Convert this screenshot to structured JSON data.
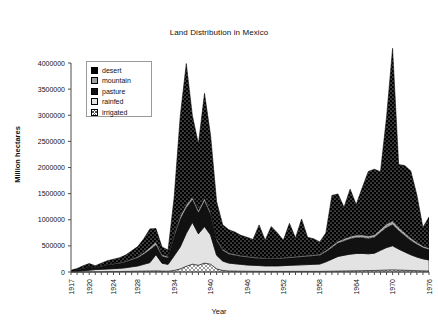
{
  "chart_data": {
    "type": "area",
    "title": "Land Distribution in Mexico",
    "xlabel": "Year",
    "ylabel": "Million hectares",
    "stacked": true,
    "grid": false,
    "legend_position": "inside-top-left",
    "ylim": [
      0,
      4000000
    ],
    "ytick_labels": [
      "4000000",
      "3500000",
      "3000000",
      "2500000",
      "2000000",
      "1500000",
      "1000000",
      "500000",
      "0"
    ],
    "ytick_values": [
      4000000,
      3500000,
      3000000,
      2500000,
      2000000,
      1500000,
      1000000,
      500000,
      0
    ],
    "xlim": [
      1917,
      1976
    ],
    "xtick_labels": [
      "1917",
      "1920",
      "1924",
      "1928",
      "1934",
      "1940",
      "1946",
      "1952",
      "1958",
      "1964",
      "1970",
      "1976"
    ],
    "xtick_values": [
      1917,
      1920,
      1924,
      1928,
      1934,
      1940,
      1946,
      1952,
      1958,
      1964,
      1970,
      1976
    ],
    "x": [
      1917,
      1918,
      1919,
      1920,
      1921,
      1922,
      1923,
      1924,
      1925,
      1926,
      1927,
      1928,
      1929,
      1930,
      1931,
      1932,
      1933,
      1934,
      1935,
      1936,
      1937,
      1938,
      1939,
      1940,
      1941,
      1942,
      1943,
      1944,
      1945,
      1946,
      1947,
      1948,
      1949,
      1950,
      1951,
      1952,
      1953,
      1954,
      1955,
      1956,
      1957,
      1958,
      1959,
      1960,
      1961,
      1962,
      1963,
      1964,
      1965,
      1966,
      1967,
      1968,
      1969,
      1970,
      1971,
      1972,
      1973,
      1974,
      1975,
      1976
    ],
    "series": [
      {
        "name": "irrigated",
        "swatch": "irrigated-swatch",
        "values": [
          2000,
          3000,
          4000,
          5000,
          6000,
          7000,
          8000,
          9000,
          10000,
          12000,
          14000,
          16000,
          18000,
          20000,
          22000,
          18000,
          16000,
          30000,
          60000,
          110000,
          150000,
          130000,
          170000,
          150000,
          60000,
          30000,
          20000,
          18000,
          16000,
          15000,
          14000,
          13000,
          12000,
          12000,
          12000,
          12000,
          12000,
          12000,
          12000,
          12000,
          12000,
          12000,
          14000,
          16000,
          18000,
          20000,
          22000,
          24000,
          26000,
          28000,
          30000,
          34000,
          38000,
          42000,
          38000,
          34000,
          30000,
          26000,
          22000,
          20000
        ]
      },
      {
        "name": "rainfed",
        "swatch": "rainfed-swatch",
        "values": [
          8000,
          12000,
          20000,
          30000,
          40000,
          45000,
          50000,
          55000,
          60000,
          70000,
          85000,
          100000,
          130000,
          160000,
          310000,
          150000,
          130000,
          280000,
          420000,
          630000,
          800000,
          600000,
          700000,
          560000,
          260000,
          180000,
          150000,
          140000,
          130000,
          120000,
          115000,
          110000,
          105000,
          105000,
          105000,
          110000,
          115000,
          120000,
          125000,
          130000,
          135000,
          140000,
          180000,
          230000,
          280000,
          300000,
          320000,
          330000,
          330000,
          320000,
          330000,
          380000,
          430000,
          460000,
          400000,
          350000,
          300000,
          260000,
          230000,
          210000
        ]
      },
      {
        "name": "pasture",
        "swatch": "pasture-swatch",
        "values": [
          12000,
          25000,
          45000,
          60000,
          35000,
          55000,
          75000,
          85000,
          95000,
          110000,
          130000,
          150000,
          190000,
          240000,
          180000,
          130000,
          120000,
          360000,
          520000,
          480000,
          430000,
          400000,
          480000,
          380000,
          280000,
          200000,
          170000,
          160000,
          150000,
          145000,
          140000,
          135000,
          130000,
          130000,
          130000,
          135000,
          140000,
          145000,
          150000,
          155000,
          160000,
          165000,
          190000,
          220000,
          250000,
          270000,
          290000,
          300000,
          300000,
          290000,
          300000,
          340000,
          380000,
          400000,
          350000,
          310000,
          270000,
          240000,
          210000,
          195000
        ]
      },
      {
        "name": "mountain",
        "swatch": "mountain-swatch",
        "values": [
          4000,
          7000,
          10000,
          12000,
          10000,
          12000,
          14000,
          16000,
          18000,
          22000,
          26000,
          30000,
          40000,
          55000,
          70000,
          40000,
          35000,
          60000,
          80000,
          70000,
          65000,
          60000,
          70000,
          60000,
          45000,
          35000,
          30000,
          28000,
          26000,
          25000,
          24000,
          23000,
          22000,
          22000,
          22000,
          23000,
          24000,
          25000,
          26000,
          27000,
          28000,
          29000,
          34000,
          40000,
          46000,
          50000,
          54000,
          58000,
          58000,
          56000,
          58000,
          66000,
          74000,
          80000,
          70000,
          62000,
          54000,
          48000,
          42000,
          38000
        ]
      },
      {
        "name": "desert",
        "swatch": "desert-swatch",
        "values": [
          6000,
          20000,
          40000,
          55000,
          30000,
          50000,
          70000,
          80000,
          90000,
          110000,
          150000,
          190000,
          260000,
          350000,
          250000,
          140000,
          120000,
          700000,
          1900000,
          2700000,
          1550000,
          1260000,
          2000000,
          1470000,
          700000,
          460000,
          440000,
          420000,
          380000,
          360000,
          330000,
          620000,
          340000,
          600000,
          480000,
          330000,
          640000,
          350000,
          700000,
          340000,
          300000,
          230000,
          330000,
          960000,
          900000,
          600000,
          900000,
          580000,
          900000,
          1230000,
          1250000,
          1100000,
          2040000,
          3300000,
          1200000,
          1280000,
          1280000,
          900000,
          350000,
          590000
        ]
      }
    ],
    "legend": [
      {
        "label": "desert",
        "swatch": "desert-swatch"
      },
      {
        "label": "mountain",
        "swatch": "mountain-swatch"
      },
      {
        "label": "pasture",
        "swatch": "pasture-swatch"
      },
      {
        "label": "rainfed",
        "swatch": "rainfed-swatch"
      },
      {
        "label": "irrigated",
        "swatch": "irrigated-swatch"
      }
    ],
    "colors": {
      "desert": "#000000",
      "mountain": "#9d9d9d",
      "pasture": "#111111",
      "rainfed": "#e2e2e2",
      "irrigated": "#ffffff",
      "axis": "#4c4c4c",
      "text": "#111111"
    }
  }
}
